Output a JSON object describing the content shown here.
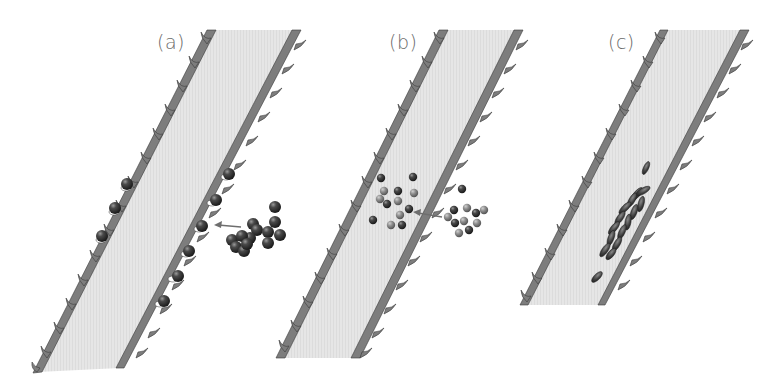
{
  "figure": {
    "panels": [
      {
        "id": "a",
        "label": "(a)",
        "description": "Vessel segment with dark particles aggregated in a cluster outside the wall; an arrow points from the cluster to particles attached along the inner surface of the right wall; particles also lodged in the left wall folds.",
        "elements": [
          "vessel-band",
          "serrated-walls",
          "wall-bound-particles",
          "particle-cluster",
          "arrow"
        ]
      },
      {
        "id": "b",
        "label": "(b)",
        "description": "Vessel segment with a mix of dark and light particles dispersed outside the wall; an arrow points into the lumen where a similar mix of particles is dispersed.",
        "elements": [
          "vessel-band",
          "serrated-walls",
          "dispersed-particles-inside",
          "dispersed-particles-outside",
          "arrow"
        ]
      },
      {
        "id": "c",
        "label": "(c)",
        "description": "Shorter vessel segment with a cluster of elongated oval cells aggregated in the lumen near the right wall.",
        "elements": [
          "vessel-band",
          "serrated-walls",
          "elongated-cell-aggregate"
        ]
      }
    ],
    "colors": {
      "background": "#ffffff",
      "lumen_fill": "#e4e4e4",
      "wall_fill": "#7d7d7d",
      "wall_outline": "#3a3a3a",
      "particle_dark": "#2e2e2e",
      "particle_light": "#8c8c8c",
      "arrow": "#6e6e6e",
      "label_text": "#6a6a6a"
    }
  }
}
